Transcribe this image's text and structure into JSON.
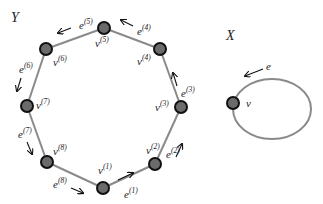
{
  "graph_Y": {
    "title": "Y",
    "vertices": [
      {
        "id": "v1",
        "label": "v",
        "index": "(1)"
      },
      {
        "id": "v2",
        "label": "v",
        "index": "(2)"
      },
      {
        "id": "v3",
        "label": "v",
        "index": "(3)"
      },
      {
        "id": "v4",
        "label": "v",
        "index": "(4)"
      },
      {
        "id": "v5",
        "label": "v",
        "index": "(5)"
      },
      {
        "id": "v6",
        "label": "v",
        "index": "(6)"
      },
      {
        "id": "v7",
        "label": "v",
        "index": "(7)"
      },
      {
        "id": "v8",
        "label": "v",
        "index": "(8)"
      }
    ],
    "edges": [
      {
        "id": "e1",
        "label": "e",
        "index": "(1)",
        "from": "v1",
        "to": "v2"
      },
      {
        "id": "e2",
        "label": "e",
        "index": "(2)",
        "from": "v2",
        "to": "v3"
      },
      {
        "id": "e3",
        "label": "e",
        "index": "(3)",
        "from": "v3",
        "to": "v4"
      },
      {
        "id": "e4",
        "label": "e",
        "index": "(4)",
        "from": "v4",
        "to": "v5"
      },
      {
        "id": "e5",
        "label": "e",
        "index": "(5)",
        "from": "v5",
        "to": "v6"
      },
      {
        "id": "e6",
        "label": "e",
        "index": "(6)",
        "from": "v6",
        "to": "v7"
      },
      {
        "id": "e7",
        "label": "e",
        "index": "(7)",
        "from": "v7",
        "to": "v8"
      },
      {
        "id": "e8",
        "label": "e",
        "index": "(8)",
        "from": "v8",
        "to": "v1"
      }
    ]
  },
  "graph_X": {
    "title": "X",
    "vertex": {
      "id": "v",
      "label": "v"
    },
    "loop_edge": {
      "id": "e",
      "label": "e"
    }
  },
  "colors": {
    "edge": "#8a8a8a",
    "node_fill": "#6b6b6b",
    "node_stroke": "#111111"
  }
}
